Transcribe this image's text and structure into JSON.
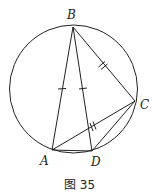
{
  "figure": {
    "caption": "图 35",
    "circle": {
      "cx": 73.5,
      "cy": 89,
      "r": 64
    },
    "points": {
      "A": {
        "label": "A",
        "x": 52,
        "y": 150,
        "lx": 41,
        "ly": 165
      },
      "B": {
        "label": "B",
        "x": 73,
        "y": 27,
        "lx": 67,
        "ly": 19
      },
      "C": {
        "label": "C",
        "x": 135,
        "y": 101,
        "lx": 140,
        "ly": 109
      },
      "D": {
        "label": "D",
        "x": 92,
        "y": 151,
        "lx": 92,
        "ly": 166
      }
    },
    "segments": [
      "AB",
      "BD",
      "BC",
      "AC",
      "CD",
      "AD"
    ],
    "equal_marks": {
      "single_tick": [
        "AB",
        "BD"
      ],
      "double_tick": [
        "BC",
        "AC"
      ]
    },
    "colors": {
      "stroke": "#222222",
      "background": "#ffffff"
    }
  }
}
